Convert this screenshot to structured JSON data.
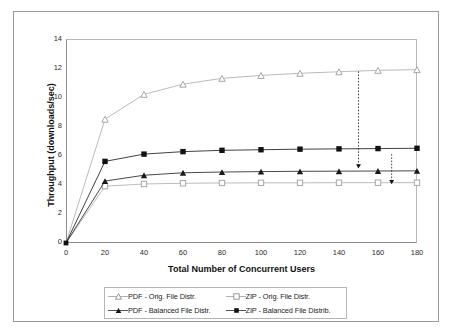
{
  "chart_data": {
    "type": "line",
    "title": "",
    "xlabel": "Total Number of Concurrent Users",
    "ylabel": "Throughput (downloads/sec)",
    "x": [
      0,
      20,
      40,
      60,
      80,
      100,
      120,
      140,
      160,
      180
    ],
    "xlim": [
      0,
      180
    ],
    "ylim": [
      0,
      14
    ],
    "xticks": [
      "0",
      "20",
      "40",
      "60",
      "80",
      "100",
      "120",
      "140",
      "160",
      "180"
    ],
    "yticks": [
      "0",
      "2",
      "4",
      "6",
      "8",
      "10",
      "12",
      "14"
    ],
    "grid": false,
    "legend_position": "bottom",
    "series": [
      {
        "name": "PDF - Orig. File Distr.",
        "marker": "open-triangle",
        "color": "#9e9e9e",
        "values": [
          0,
          8.5,
          10.2,
          10.9,
          11.3,
          11.5,
          11.65,
          11.75,
          11.85,
          11.9
        ]
      },
      {
        "name": "ZIP - Orig. File Distr.",
        "marker": "open-square",
        "color": "#9e9e9e",
        "values": [
          0,
          3.9,
          4.05,
          4.1,
          4.12,
          4.13,
          4.13,
          4.14,
          4.14,
          4.14
        ]
      },
      {
        "name": "PDF - Balanced File Distr.",
        "marker": "filled-triangle",
        "color": "#1a1a1a",
        "values": [
          0,
          4.25,
          4.65,
          4.82,
          4.87,
          4.9,
          4.92,
          4.93,
          4.94,
          4.95
        ]
      },
      {
        "name": "ZIP - Balanced File Distrib.",
        "marker": "filled-square",
        "color": "#111111",
        "values": [
          0,
          5.6,
          6.1,
          6.27,
          6.36,
          6.4,
          6.44,
          6.46,
          6.48,
          6.5
        ]
      }
    ],
    "annotations": [
      {
        "name": "arrow-150",
        "style": "dashed-down-arrow",
        "x": 150,
        "y_start": 11.78,
        "y_end": 5.2
      },
      {
        "name": "arrow-167",
        "style": "dashed-down-arrow",
        "x": 167,
        "y_start": 6.1,
        "y_end": 4.12
      }
    ]
  },
  "legend": {
    "entries": [
      {
        "label": "PDF - Orig. File Distr."
      },
      {
        "label": "ZIP - Orig. File Distr."
      },
      {
        "label": "PDF - Balanced File Distr."
      },
      {
        "label": "ZIP - Balanced File Distrib."
      }
    ]
  },
  "axes": {
    "y": {
      "label": "Throughput (downloads/sec)",
      "ticks": [
        "14",
        "12",
        "10",
        "8",
        "6",
        "4",
        "2",
        "0"
      ]
    },
    "x": {
      "label": "Total Number of Concurrent Users",
      "ticks": [
        "0",
        "20",
        "40",
        "60",
        "80",
        "100",
        "120",
        "140",
        "160",
        "180"
      ]
    }
  }
}
